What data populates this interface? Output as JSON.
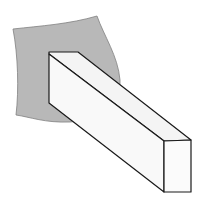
{
  "diagram": {
    "colors": {
      "background": "#ffffff",
      "wall_fill": "#b8b8b8",
      "wall_stroke": "#808080",
      "beam_top": "#f4f4f4",
      "beam_side": "#f9f9f9",
      "beam_end": "#fbfbfb",
      "edge": "#1a1a1a"
    }
  }
}
